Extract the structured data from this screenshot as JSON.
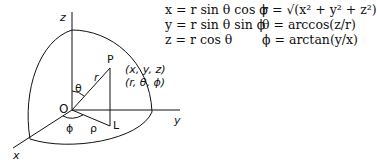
{
  "diagram": {
    "axes": {
      "z": "z",
      "y": "y",
      "x": "x"
    },
    "points": {
      "origin": "O",
      "point": "P",
      "projection": "L"
    },
    "segments": {
      "radius": "r",
      "rho": "ρ"
    },
    "angles": {
      "theta": "θ",
      "phi": "ϕ"
    },
    "coord_labels": [
      "(x, y, z)",
      "(r, θ, ϕ)"
    ]
  },
  "equations": {
    "cartesian": [
      "x = r sin θ cos ϕ",
      "y = r sin θ sin ϕ",
      "z = r cos θ"
    ],
    "spherical": [
      "r = √(x² + y² + z²)",
      "θ = arccos(z/r)",
      "ϕ = arctan(y/x)"
    ]
  },
  "colors": {
    "ink": "#111111",
    "background": "#ffffff"
  }
}
